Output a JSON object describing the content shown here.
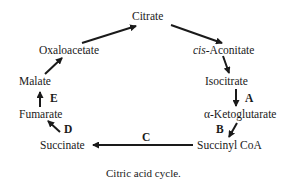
{
  "diagram": {
    "caption": "Citric acid cycle.",
    "nodes": {
      "citrate": "Citrate",
      "cis_prefix": "cis",
      "cis_aconitate_rest": "-Aconitate",
      "isocitrate": "Isocitrate",
      "alpha_ketoglutarate": "α-Ketoglutarate",
      "succinyl_coa": "Succinyl CoA",
      "succinate": "Succinate",
      "fumarate": "Fumarate",
      "malate": "Malate",
      "oxaloacetate": "Oxaloacetate"
    },
    "enzymes": {
      "A": "A",
      "B": "B",
      "C": "C",
      "D": "D",
      "E": "E"
    },
    "colors": {
      "ink": "#1a1a1a",
      "background": "#ffffff"
    }
  }
}
